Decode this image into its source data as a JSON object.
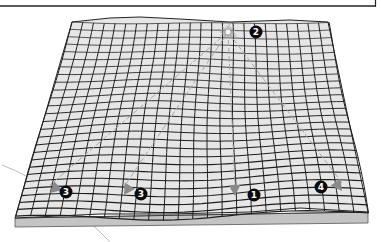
{
  "diagram": {
    "type": "3d-grid-surface",
    "colors": {
      "surface": "#e4e4e4",
      "grid_line": "#1e1e1e",
      "slab_top": "#cfcfcf",
      "slab_side": "#b8b8b8",
      "arrow": "#8a8a8a",
      "ray": "#a8a8a8",
      "badge_fill": "#0a0a0a",
      "badge_text": "#ffffff",
      "frame": "#222222",
      "arc": "#bdbdbd"
    },
    "epicenter": {
      "label": "burst",
      "x": 228,
      "y": 32
    },
    "markers": [
      {
        "id": "marker-2",
        "label": "2",
        "x": 256,
        "y": 32
      },
      {
        "id": "marker-3a",
        "label": "3",
        "x": 66,
        "y": 192
      },
      {
        "id": "marker-3b",
        "label": "3",
        "x": 141,
        "y": 194
      },
      {
        "id": "marker-1",
        "label": "1",
        "x": 254,
        "y": 195
      },
      {
        "id": "marker-4",
        "label": "4",
        "x": 321,
        "y": 187
      }
    ],
    "arrows": [
      {
        "id": "arrow-3a",
        "to_x": 50,
        "to_y": 193
      },
      {
        "id": "arrow-3b",
        "to_x": 124,
        "to_y": 195
      },
      {
        "id": "arrow-1",
        "to_x": 235,
        "to_y": 196
      },
      {
        "id": "arrow-4",
        "to_x": 342,
        "to_y": 191
      }
    ]
  }
}
